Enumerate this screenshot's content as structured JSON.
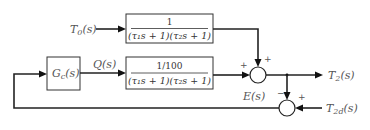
{
  "inputs": {
    "disturbance": "T",
    "disturbance_sub": "0",
    "disturbance_arg": "(s)",
    "setpoint": "T",
    "setpoint_sub": "2d",
    "setpoint_arg": "(s)"
  },
  "signals": {
    "control": "Q(s)",
    "error": "E(s)",
    "output": "T",
    "output_sub": "2",
    "output_arg": "(s)"
  },
  "blocks": {
    "controller": {
      "label": "G",
      "sub": "c",
      "arg": "(s)"
    },
    "disturbance_tf": {
      "numerator": "1",
      "denominator": "(τ₁s + 1)(τ₂s + 1)"
    },
    "process_tf": {
      "numerator": "1/100",
      "denominator": "(τ₁s + 1)(τ₂s + 1)"
    }
  },
  "summing_junctions": {
    "output_sum": {
      "top_sign": "+",
      "left_sign": "+"
    },
    "error_sum": {
      "top_sign": "−",
      "right_sign": "+"
    }
  }
}
